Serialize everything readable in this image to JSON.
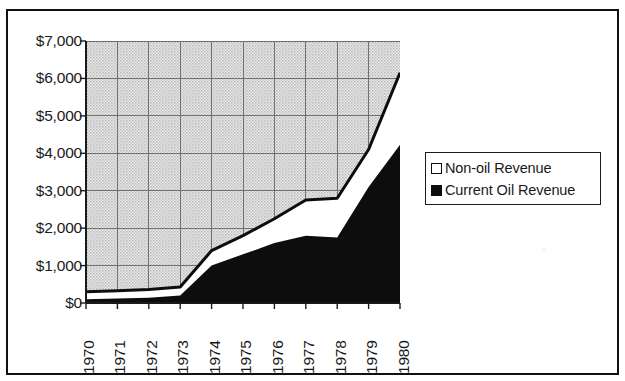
{
  "chart_data": {
    "type": "area",
    "stacked": true,
    "title": "",
    "subtitle": "",
    "xlabel": "",
    "ylabel": "",
    "categories": [
      "1970",
      "1971",
      "1972",
      "1973",
      "1974",
      "1975",
      "1976",
      "1977",
      "1978",
      "1979",
      "1980"
    ],
    "x": [
      1970,
      1971,
      1972,
      1973,
      1974,
      1975,
      1976,
      1977,
      1978,
      1979,
      1980
    ],
    "series": [
      {
        "name": "Current Oil Revenue",
        "fill": "#0d0d0d",
        "values": [
          100,
          120,
          140,
          200,
          1000,
          1300,
          1600,
          1800,
          1750,
          3100,
          4230
        ]
      },
      {
        "name": "Non-oil Revenue",
        "fill": "#ffffff",
        "values": [
          200,
          210,
          220,
          230,
          400,
          500,
          650,
          950,
          1050,
          1000,
          1920
        ]
      }
    ],
    "totals": [
      300,
      330,
      360,
      430,
      1400,
      1800,
      2250,
      2750,
      2800,
      4100,
      6150
    ],
    "ylim": [
      0,
      7000
    ],
    "ytick_values": [
      0,
      1000,
      2000,
      3000,
      4000,
      5000,
      6000,
      7000
    ],
    "ytick_labels": [
      "$0",
      "$1,000",
      "$2,000",
      "$3,000",
      "$4,000",
      "$5,000",
      "$6,000",
      "$7,000"
    ],
    "xlim": [
      1970,
      1980
    ],
    "grid": true,
    "plot_background": "#d8d8d8",
    "legend_position": "right",
    "legend": [
      {
        "label": "Non-oil Revenue",
        "marker": "open-square",
        "color": "#ffffff"
      },
      {
        "label": "Current Oil Revenue",
        "marker": "filled-square",
        "color": "#0d0d0d"
      }
    ]
  },
  "axes": {
    "y_labels": [
      "$7,000",
      "$6,000",
      "$5,000",
      "$4,000",
      "$3,000",
      "$2,000",
      "$1,000",
      "$0"
    ],
    "x_labels": [
      "1970",
      "1971",
      "1972",
      "1973",
      "1974",
      "1975",
      "1976",
      "1977",
      "1978",
      "1979",
      "1980"
    ]
  },
  "legend": {
    "items": [
      {
        "label": "Non-oil Revenue"
      },
      {
        "label": "Current Oil Revenue"
      }
    ]
  },
  "colors": {
    "plot_fill": "#d8d8d8",
    "series_oil": "#0d0d0d",
    "series_nonoil": "#ffffff",
    "axis": "#1a1a1a",
    "grid": "#6f6f6f",
    "frame": "#111111"
  }
}
